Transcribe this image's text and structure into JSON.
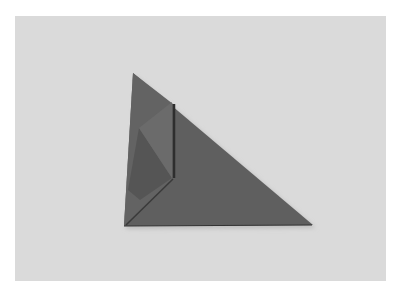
{
  "image": {
    "subject": "origami-triangle-fold",
    "colors": {
      "border": "#ffffff",
      "background": "#dadada",
      "paper_main": "#5f5f5f",
      "paper_left_panel": "#636363",
      "flap": "#6a6a6a",
      "flap_shadow": "#4a4a4a",
      "crease": "#2e2e2e"
    }
  }
}
